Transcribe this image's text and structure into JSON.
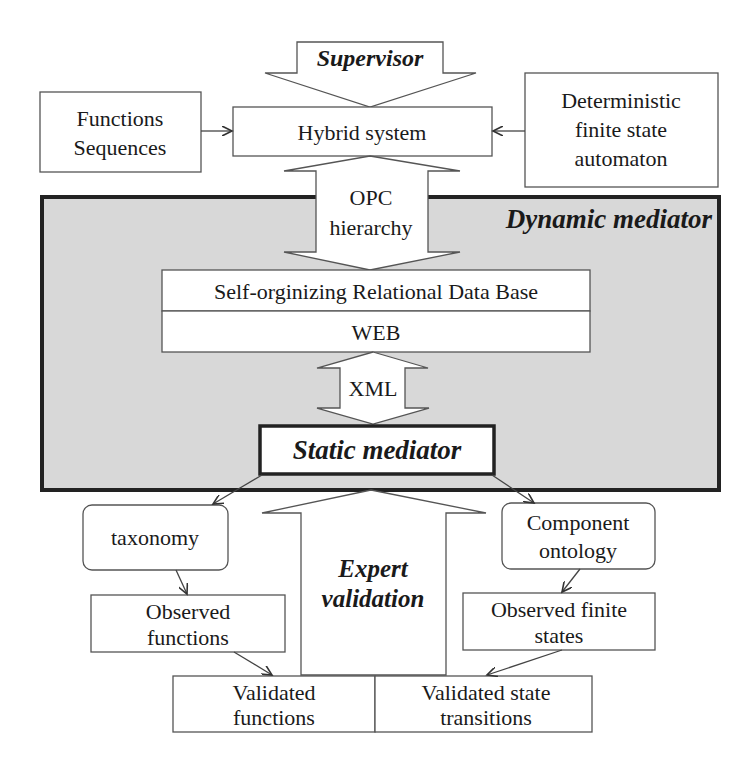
{
  "diagram": {
    "colors": {
      "background": "#ffffff",
      "mediator_fill": "#d8d8d8",
      "border": "#222222",
      "box_stroke": "#555555",
      "text": "#1a1a1a"
    },
    "supervisor": {
      "label": "Supervisor"
    },
    "hybrid_system": {
      "label": "Hybrid system"
    },
    "functions_sequences": {
      "line1": "Functions",
      "line2": "Sequences"
    },
    "dfsa": {
      "line1": "Deterministic",
      "line2": "finite state",
      "line3": "automaton"
    },
    "opc": {
      "line1": "OPC",
      "line2": "hierarchy"
    },
    "dynamic_mediator": {
      "label": "Dynamic mediator"
    },
    "database": {
      "label": "Self-orginizing Relational Data Base"
    },
    "web": {
      "label": "WEB"
    },
    "xml": {
      "label": "XML"
    },
    "static_mediator": {
      "label": "Static mediator"
    },
    "taxonomy": {
      "label": "taxonomy"
    },
    "component_ontology": {
      "line1": "Component",
      "line2": "ontology"
    },
    "expert_validation": {
      "line1": "Expert",
      "line2": "validation"
    },
    "observed_functions": {
      "line1": "Observed",
      "line2": "functions"
    },
    "observed_finite_states": {
      "line1": "Observed finite",
      "line2": "states"
    },
    "validated_functions": {
      "line1": "Validated",
      "line2": "functions"
    },
    "validated_state_transitions": {
      "line1": "Validated state",
      "line2": "transitions"
    }
  }
}
